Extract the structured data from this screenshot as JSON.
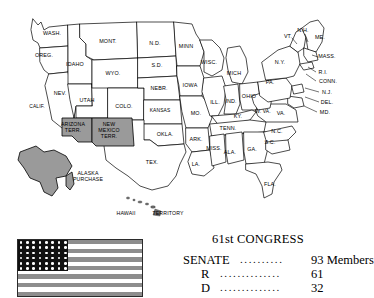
{
  "map": {
    "title": "United States map circa 1909",
    "colors": {
      "territory_fill": "#9a9a9a",
      "state_fill": "#ffffff",
      "outline": "#000000"
    },
    "states": [
      {
        "id": "wash",
        "label": "WASH.",
        "x": 52,
        "y": 33
      },
      {
        "id": "oreg",
        "label": "OREG.",
        "x": 44,
        "y": 55
      },
      {
        "id": "calif",
        "label": "CALIF.",
        "x": 37,
        "y": 107
      },
      {
        "id": "idaho",
        "label": "IDAHO",
        "x": 75,
        "y": 64
      },
      {
        "id": "nev",
        "label": "NEV.",
        "x": 60,
        "y": 93
      },
      {
        "id": "utah",
        "label": "UTAH",
        "x": 87,
        "y": 100
      },
      {
        "id": "mont",
        "label": "MONT.",
        "x": 108,
        "y": 41
      },
      {
        "id": "wyo",
        "label": "WYO.",
        "x": 113,
        "y": 73
      },
      {
        "id": "colo",
        "label": "COLO.",
        "x": 124,
        "y": 106
      },
      {
        "id": "nd",
        "label": "N.D.",
        "x": 155,
        "y": 43
      },
      {
        "id": "sd",
        "label": "S.D.",
        "x": 157,
        "y": 65
      },
      {
        "id": "nebr",
        "label": "NEBR.",
        "x": 159,
        "y": 88
      },
      {
        "id": "kansas",
        "label": "KANSAS",
        "x": 160,
        "y": 111
      },
      {
        "id": "okla",
        "label": "OKLA.",
        "x": 165,
        "y": 134
      },
      {
        "id": "tex",
        "label": "TEX.",
        "x": 152,
        "y": 162
      },
      {
        "id": "minn",
        "label": "MINN",
        "x": 186,
        "y": 46
      },
      {
        "id": "iowa",
        "label": "IOWA",
        "x": 190,
        "y": 85
      },
      {
        "id": "mo",
        "label": "MO.",
        "x": 196,
        "y": 113
      },
      {
        "id": "ark",
        "label": "ARK.",
        "x": 196,
        "y": 139
      },
      {
        "id": "la",
        "label": "LA.",
        "x": 196,
        "y": 164
      },
      {
        "id": "wisc",
        "label": "WISC.",
        "x": 209,
        "y": 62
      },
      {
        "id": "ill",
        "label": "ILL.",
        "x": 215,
        "y": 102
      },
      {
        "id": "miss",
        "label": "MISS.",
        "x": 214,
        "y": 148
      },
      {
        "id": "ind",
        "label": "IND.",
        "x": 231,
        "y": 101
      },
      {
        "id": "mich",
        "label": "MICH",
        "x": 234,
        "y": 73
      },
      {
        "id": "ky",
        "label": "KY.",
        "x": 238,
        "y": 116
      },
      {
        "id": "tenn",
        "label": "TENN.",
        "x": 228,
        "y": 128
      },
      {
        "id": "ala",
        "label": "ALA.",
        "x": 230,
        "y": 152
      },
      {
        "id": "ohio",
        "label": "OHIO",
        "x": 249,
        "y": 96
      },
      {
        "id": "ga",
        "label": "GA.",
        "x": 252,
        "y": 149
      },
      {
        "id": "wva",
        "label": "W. VA.",
        "x": 263,
        "y": 112
      },
      {
        "id": "pa",
        "label": "PA.",
        "x": 270,
        "y": 82
      },
      {
        "id": "va",
        "label": "VA.",
        "x": 281,
        "y": 113
      },
      {
        "id": "nc",
        "label": "N.C.",
        "x": 277,
        "y": 131
      },
      {
        "id": "sc",
        "label": "S.C.",
        "x": 270,
        "y": 142
      },
      {
        "id": "fla",
        "label": "FLA.",
        "x": 270,
        "y": 184
      },
      {
        "id": "ny",
        "label": "N.Y.",
        "x": 280,
        "y": 62
      },
      {
        "id": "vt",
        "label": "VT.",
        "x": 288,
        "y": 36
      },
      {
        "id": "nh",
        "label": "N.H.",
        "x": 303,
        "y": 30
      },
      {
        "id": "me",
        "label": "ME.",
        "x": 320,
        "y": 37
      },
      {
        "id": "mass",
        "label": "MASS.",
        "x": 327,
        "y": 56
      },
      {
        "id": "ri",
        "label": "R.I.",
        "x": 323,
        "y": 72
      },
      {
        "id": "conn",
        "label": "CONN.",
        "x": 328,
        "y": 81
      },
      {
        "id": "nj",
        "label": "N.J.",
        "x": 327,
        "y": 92
      },
      {
        "id": "del",
        "label": "DEL.",
        "x": 327,
        "y": 102
      },
      {
        "id": "md",
        "label": "MD.",
        "x": 325,
        "y": 112
      }
    ],
    "territories": [
      {
        "id": "arizona",
        "label": "ARIZONA\nTERR.",
        "x": 73,
        "y": 128
      },
      {
        "id": "new-mexico",
        "label": "NEW\nMEXICO\nTERR.",
        "x": 109,
        "y": 131
      },
      {
        "id": "alaska",
        "label": "ALASKA\nPURCHASE",
        "x": 88,
        "y": 177
      },
      {
        "id": "hawaii",
        "label": "HAWAII",
        "x": 126,
        "y": 214
      },
      {
        "id": "hawaii-terr",
        "label": "TERRITORY",
        "x": 168,
        "y": 214
      }
    ]
  },
  "flag": {
    "name": "united-states-flag",
    "stripes": 13,
    "star_rows": 6,
    "star_columns": 8,
    "stars": 46,
    "colors": {
      "stripe": "#8d8d8d",
      "canton": "#111111",
      "star": "#ffffff"
    }
  },
  "congress": {
    "title": "61st CONGRESS",
    "rows": [
      {
        "id": "senate",
        "label": "SENATE",
        "dots": "..........",
        "value": "93 Members"
      },
      {
        "id": "r",
        "label": "R",
        "dots": "..............",
        "value": "61"
      },
      {
        "id": "d",
        "label": "D",
        "dots": "..............",
        "value": "32"
      }
    ]
  }
}
